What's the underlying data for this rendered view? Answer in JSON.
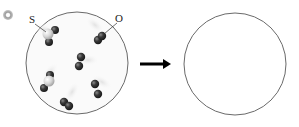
{
  "diagram": {
    "bullet_icon": "circled-bullet-icon",
    "labels": {
      "sulfur": "S",
      "oxygen": "O"
    },
    "arrow_icon": "right-arrow-icon",
    "colors": {
      "oxygen_atom": "#3a3a3a",
      "sulfur_atom": "#d8d8d8",
      "circle_stroke": "#555555",
      "arrow": "#000000"
    },
    "before_container": {
      "molecules": [
        {
          "type": "SO2",
          "x": 53,
          "y": 35
        },
        {
          "type": "O2",
          "x": 100,
          "y": 34
        },
        {
          "type": "O2",
          "x": 80,
          "y": 60
        },
        {
          "type": "SO2",
          "x": 48,
          "y": 80
        },
        {
          "type": "O2",
          "x": 97,
          "y": 88
        },
        {
          "type": "O2",
          "x": 67,
          "y": 103
        }
      ]
    },
    "after_container": {
      "molecules": []
    }
  }
}
